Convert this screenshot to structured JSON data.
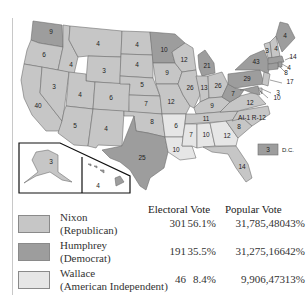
{
  "colors": {
    "republican": "#c6c6c6",
    "democrat": "#9d9d9d",
    "independent": "#e6e6e6"
  },
  "map": {
    "states": [
      {
        "abbr": "WA",
        "votes": "9",
        "party": "democrat"
      },
      {
        "abbr": "OR",
        "votes": "6",
        "party": "republican"
      },
      {
        "abbr": "CA",
        "votes": "40",
        "party": "republican"
      },
      {
        "abbr": "ID",
        "votes": "4",
        "party": "republican"
      },
      {
        "abbr": "NV",
        "votes": "3",
        "party": "republican"
      },
      {
        "abbr": "MT",
        "votes": "4",
        "party": "republican"
      },
      {
        "abbr": "WY",
        "votes": "3",
        "party": "republican"
      },
      {
        "abbr": "UT",
        "votes": "4",
        "party": "republican"
      },
      {
        "abbr": "AZ",
        "votes": "5",
        "party": "republican"
      },
      {
        "abbr": "CO",
        "votes": "6",
        "party": "republican"
      },
      {
        "abbr": "NM",
        "votes": "4",
        "party": "republican"
      },
      {
        "abbr": "ND",
        "votes": "4",
        "party": "republican"
      },
      {
        "abbr": "SD",
        "votes": "4",
        "party": "republican"
      },
      {
        "abbr": "NE",
        "votes": "5",
        "party": "republican"
      },
      {
        "abbr": "KS",
        "votes": "7",
        "party": "republican"
      },
      {
        "abbr": "OK",
        "votes": "8",
        "party": "republican"
      },
      {
        "abbr": "TX",
        "votes": "25",
        "party": "democrat"
      },
      {
        "abbr": "MN",
        "votes": "10",
        "party": "democrat"
      },
      {
        "abbr": "IA",
        "votes": "9",
        "party": "republican"
      },
      {
        "abbr": "MO",
        "votes": "12",
        "party": "republican"
      },
      {
        "abbr": "AR",
        "votes": "6",
        "party": "independent"
      },
      {
        "abbr": "LA",
        "votes": "10",
        "party": "independent"
      },
      {
        "abbr": "WI",
        "votes": "12",
        "party": "republican"
      },
      {
        "abbr": "IL",
        "votes": "26",
        "party": "republican"
      },
      {
        "abbr": "MI",
        "votes": "21",
        "party": "democrat"
      },
      {
        "abbr": "IN",
        "votes": "13",
        "party": "republican"
      },
      {
        "abbr": "OH",
        "votes": "26",
        "party": "republican"
      },
      {
        "abbr": "KY",
        "votes": "9",
        "party": "republican"
      },
      {
        "abbr": "TN",
        "votes": "11",
        "party": "republican"
      },
      {
        "abbr": "MS",
        "votes": "7",
        "party": "independent"
      },
      {
        "abbr": "AL",
        "votes": "10",
        "party": "independent"
      },
      {
        "abbr": "GA",
        "votes": "12",
        "party": "independent"
      },
      {
        "abbr": "FL",
        "votes": "14",
        "party": "republican"
      },
      {
        "abbr": "SC",
        "votes": "8",
        "party": "republican"
      },
      {
        "abbr": "NC",
        "votes": "AI-1 R-12",
        "party": "republican"
      },
      {
        "abbr": "VA",
        "votes": "12",
        "party": "republican"
      },
      {
        "abbr": "WV",
        "votes": "7",
        "party": "democrat"
      },
      {
        "abbr": "PA",
        "votes": "29",
        "party": "democrat"
      },
      {
        "abbr": "NY",
        "votes": "43",
        "party": "democrat"
      },
      {
        "abbr": "VT",
        "votes": "3",
        "party": "republican"
      },
      {
        "abbr": "NH",
        "votes": "4",
        "party": "republican"
      },
      {
        "abbr": "ME",
        "votes": "4",
        "party": "democrat"
      },
      {
        "abbr": "MA",
        "votes": "14",
        "party": "democrat"
      },
      {
        "abbr": "RI",
        "votes": "4",
        "party": "democrat"
      },
      {
        "abbr": "CT",
        "votes": "8",
        "party": "democrat"
      },
      {
        "abbr": "NJ",
        "votes": "17",
        "party": "republican"
      },
      {
        "abbr": "DE",
        "votes": "3",
        "party": "republican"
      },
      {
        "abbr": "MD",
        "votes": "10",
        "party": "democrat"
      },
      {
        "abbr": "AK",
        "votes": "3",
        "party": "republican"
      },
      {
        "abbr": "HI",
        "votes": "4",
        "party": "democrat"
      }
    ],
    "dc": {
      "votes": "3",
      "label": "D.C.",
      "party": "democrat"
    }
  },
  "table": {
    "headers": {
      "electoral": "Electoral Vote",
      "popular": "Popular Vote"
    },
    "rows": [
      {
        "candidate": "Nixon",
        "party": "(Republican)",
        "color_key": "republican",
        "electoral": "301",
        "electoral_pct": "56.1%",
        "popular": "31,785,480",
        "popular_pct": "43%"
      },
      {
        "candidate": "Humphrey",
        "party": "(Democrat)",
        "color_key": "democrat",
        "electoral": "191",
        "electoral_pct": "35.5%",
        "popular": "31,275,166",
        "popular_pct": "42%"
      },
      {
        "candidate": "Wallace",
        "party": "(American Independent)",
        "color_key": "independent",
        "electoral": "46",
        "electoral_pct": "8.4%",
        "popular": "9,906,473",
        "popular_pct": "13%"
      }
    ]
  }
}
